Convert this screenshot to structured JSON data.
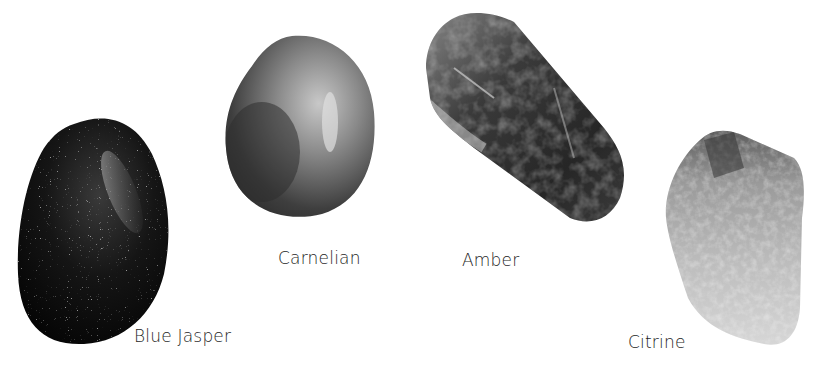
{
  "stones": [
    {
      "id": "blue-jasper",
      "label": "Blue Jasper"
    },
    {
      "id": "carnelian",
      "label": "Carnelian"
    },
    {
      "id": "amber",
      "label": "Amber"
    },
    {
      "id": "citrine",
      "label": "Citrine"
    }
  ],
  "colors": {
    "background": "#ffffff",
    "label_text": "#1e1e1e"
  }
}
